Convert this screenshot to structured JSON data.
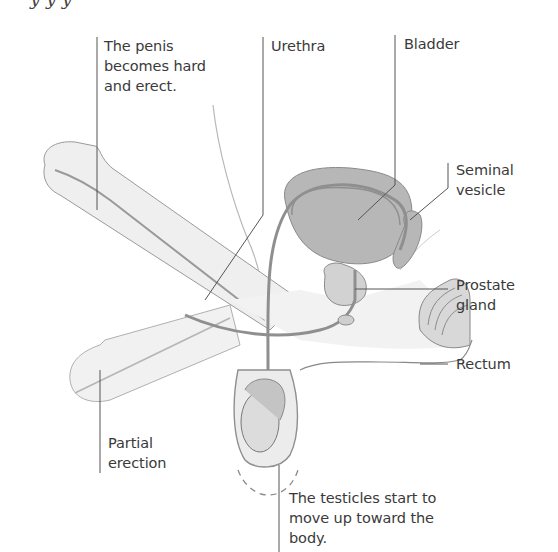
{
  "figure": {
    "title_fragment": "y   y              y",
    "labels": {
      "penis_erect": "The penis\nbecomes hard\nand erect.",
      "urethra": "Urethra",
      "bladder": "Bladder",
      "seminal_vesicle": "Seminal\nvesicle",
      "prostate": "Prostate\ngland",
      "rectum": "Rectum",
      "partial_erection": "Partial\nerection",
      "testicles": "The testicles start to\nmove up toward the\nbody."
    },
    "colors": {
      "text": "#3a3a3a",
      "leader_line": "#555555",
      "organ_fill": "#b9b9b9",
      "organ_stroke": "#8a8a8a",
      "skin_fill": "#ececec",
      "outline": "#9a9a9a"
    }
  }
}
